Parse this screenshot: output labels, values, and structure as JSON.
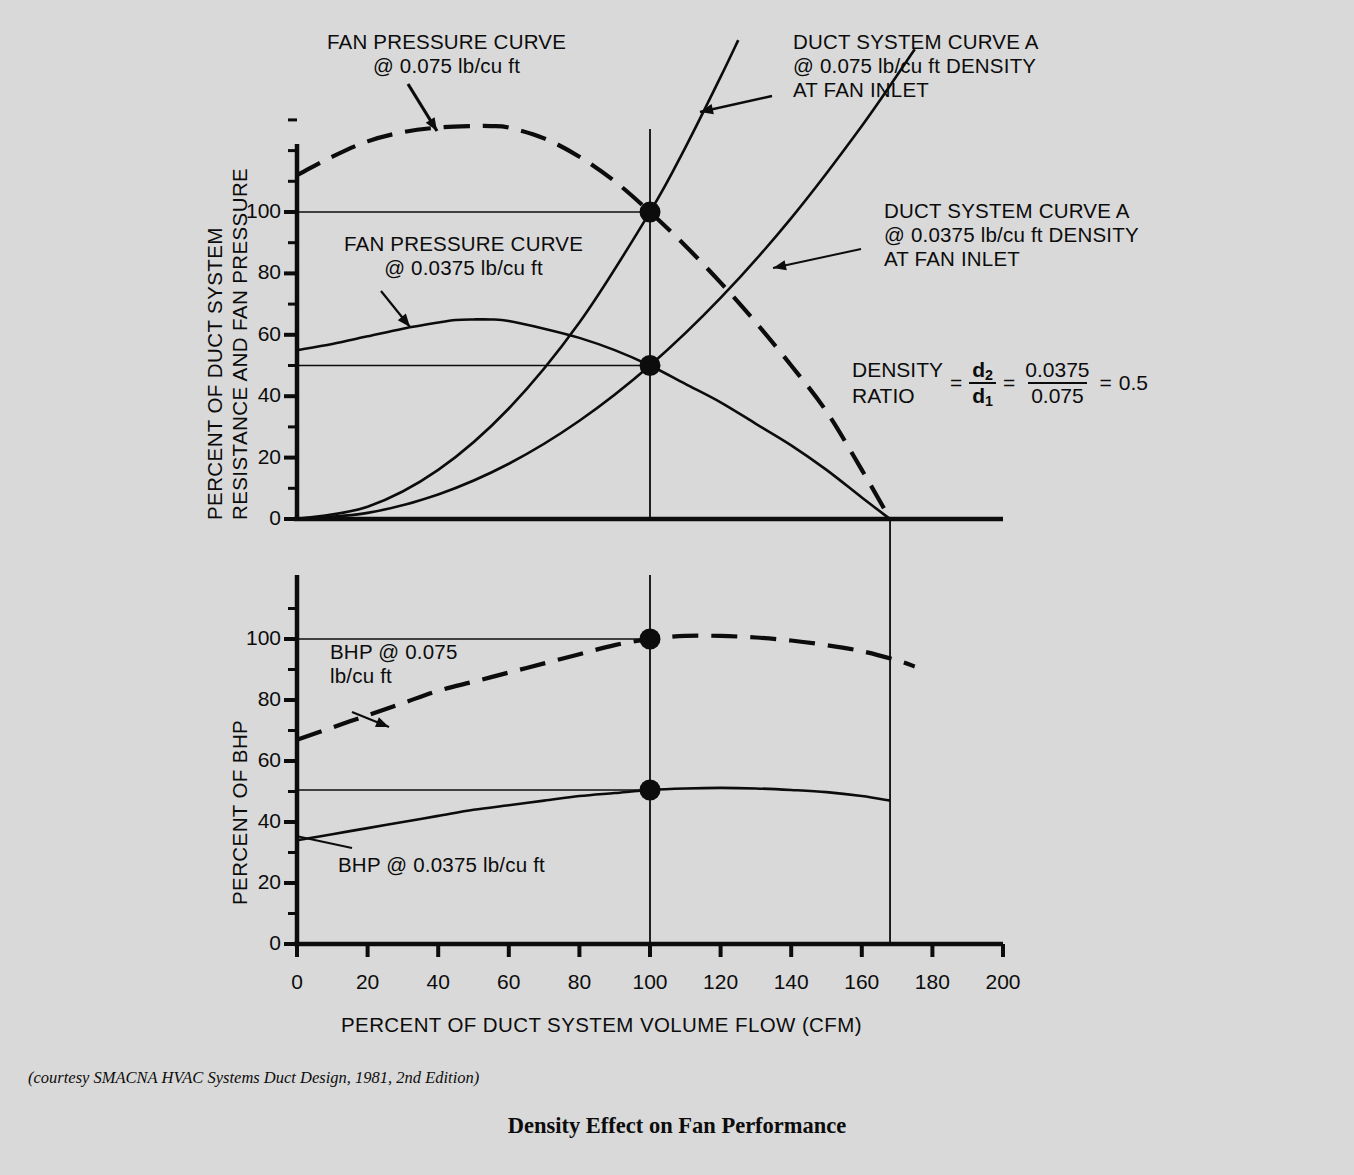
{
  "figure": {
    "title": "Density Effect on Fan Performance",
    "caption": "(courtesy SMACNA HVAC Systems Duct Design, 1981, 2nd Edition)",
    "background_color": "#d9d9d9",
    "ink_color": "#0c0c0c"
  },
  "annotations": {
    "fan_curve_075": "FAN PRESSURE CURVE\n@ 0.075 lb/cu ft",
    "duct_curve_075": "DUCT SYSTEM CURVE A\n@ 0.075 lb/cu ft DENSITY\nAT FAN INLET",
    "fan_curve_0375": "FAN PRESSURE CURVE\n@ 0.0375 lb/cu ft",
    "duct_curve_0375": "DUCT SYSTEM CURVE A\n@ 0.0375 lb/cu ft DENSITY\nAT FAN INLET",
    "bhp_075": "BHP @ 0.075\nlb/cu ft",
    "bhp_0375": "BHP @ 0.0375 lb/cu ft"
  },
  "equation": {
    "label_line1": "DENSITY",
    "label_line2": "RATIO",
    "equals": "=",
    "ratio_numerator": "d",
    "ratio_numerator_sub": "2",
    "ratio_denominator": "d",
    "ratio_denominator_sub": "1",
    "value_numerator": "0.0375",
    "value_denominator": "0.075",
    "result": "0.5"
  },
  "chart_data": [
    {
      "id": "pressure-chart",
      "type": "line",
      "title": "",
      "xlabel": "PERCENT OF DUCT SYSTEM VOLUME FLOW (CFM)",
      "ylabel": "PERCENT OF DUCT SYSTEM RESISTANCE AND FAN PRESSURE",
      "ylabel_line1": "PERCENT OF DUCT SYSTEM",
      "ylabel_line2": "RESISTANCE AND FAN PRESSURE",
      "xlim": [
        0,
        200
      ],
      "ylim": [
        0,
        130
      ],
      "xticks": [
        0,
        20,
        40,
        60,
        80,
        100,
        120,
        140,
        160,
        180,
        200
      ],
      "yticks": [
        0,
        20,
        40,
        60,
        80,
        100
      ],
      "ytick_labels": [
        "0",
        "20",
        "40",
        "60",
        "80",
        "100"
      ],
      "minor_ytick_step": 10,
      "grid": false,
      "series": [
        {
          "name": "FAN PRESSURE CURVE @ 0.075 lb/cu ft",
          "style": "dashed",
          "x": [
            0,
            10,
            20,
            30,
            40,
            50,
            55,
            60,
            70,
            80,
            90,
            100,
            110,
            120,
            130,
            140,
            150,
            160,
            168
          ],
          "values": [
            112,
            118,
            123,
            126,
            127.5,
            128,
            128,
            127.5,
            124,
            118,
            110,
            100,
            89,
            77,
            64,
            50,
            35,
            16,
            0
          ]
        },
        {
          "name": "FAN PRESSURE CURVE @ 0.0375 lb/cu ft",
          "style": "solid",
          "x": [
            0,
            10,
            20,
            30,
            40,
            45,
            50,
            55,
            60,
            70,
            80,
            90,
            100,
            110,
            120,
            130,
            140,
            150,
            160,
            168
          ],
          "values": [
            55,
            57,
            59.5,
            62,
            64,
            64.8,
            65,
            65,
            64.5,
            62,
            59,
            55,
            50,
            44,
            38,
            31,
            24,
            16,
            7,
            0
          ]
        },
        {
          "name": "DUCT SYSTEM CURVE A @ 0.075 lb/cu ft DENSITY AT FAN INLET",
          "style": "solid",
          "x": [
            0,
            20,
            40,
            60,
            80,
            100,
            110,
            120,
            125
          ],
          "values": [
            0,
            4,
            16,
            36,
            64,
            100,
            121,
            144,
            156
          ]
        },
        {
          "name": "DUCT SYSTEM CURVE A @ 0.0375 lb/cu ft DENSITY AT FAN INLET",
          "style": "solid",
          "x": [
            0,
            20,
            40,
            60,
            80,
            100,
            120,
            140,
            160,
            175
          ],
          "values": [
            0,
            2,
            8,
            18,
            32,
            50,
            72,
            98,
            128,
            153
          ]
        }
      ],
      "markers": [
        {
          "x": 100,
          "y": 100,
          "label": "operating point @ 0.075"
        },
        {
          "x": 100,
          "y": 50,
          "label": "operating point @ 0.0375"
        }
      ],
      "reference_lines": [
        {
          "orientation": "vertical",
          "value": 100
        },
        {
          "orientation": "vertical",
          "value": 168
        },
        {
          "orientation": "horizontal",
          "value": 100,
          "x_to": 100
        },
        {
          "orientation": "horizontal",
          "value": 50,
          "x_to": 100
        }
      ]
    },
    {
      "id": "bhp-chart",
      "type": "line",
      "title": "",
      "xlabel": "PERCENT OF DUCT SYSTEM VOLUME FLOW (CFM)",
      "ylabel": "PERCENT OF BHP",
      "xlim": [
        0,
        200
      ],
      "ylim": [
        0,
        120
      ],
      "xticks": [
        0,
        20,
        40,
        60,
        80,
        100,
        120,
        140,
        160,
        180,
        200
      ],
      "yticks": [
        0,
        20,
        40,
        60,
        80,
        100
      ],
      "ytick_labels": [
        "0",
        "20",
        "40",
        "60",
        "80",
        "100"
      ],
      "minor_ytick_step": 10,
      "grid": false,
      "series": [
        {
          "name": "BHP @ 0.075 lb/cu ft",
          "style": "dashed",
          "x": [
            0,
            10,
            20,
            30,
            40,
            50,
            60,
            70,
            80,
            90,
            100,
            110,
            120,
            130,
            140,
            150,
            160,
            170,
            175
          ],
          "values": [
            67,
            71,
            75,
            79,
            83,
            86,
            89,
            92,
            95,
            98,
            100,
            101,
            101,
            100.5,
            99.5,
            98,
            96,
            93,
            91
          ]
        },
        {
          "name": "BHP @ 0.0375 lb/cu ft",
          "style": "solid",
          "x": [
            0,
            10,
            20,
            30,
            40,
            50,
            60,
            70,
            80,
            90,
            100,
            110,
            120,
            130,
            140,
            150,
            160,
            168
          ],
          "values": [
            34,
            36,
            38,
            40,
            42,
            44,
            45.5,
            47,
            48.5,
            49.5,
            50.5,
            51,
            51.2,
            51,
            50.5,
            49.8,
            48.5,
            47
          ]
        }
      ],
      "markers": [
        {
          "x": 100,
          "y": 100,
          "label": "operating point @ 0.075"
        },
        {
          "x": 100,
          "y": 50.5,
          "label": "operating point @ 0.0375"
        }
      ],
      "reference_lines": [
        {
          "orientation": "vertical",
          "value": 100
        },
        {
          "orientation": "vertical",
          "value": 168
        },
        {
          "orientation": "horizontal",
          "value": 100,
          "x_to": 100
        },
        {
          "orientation": "horizontal",
          "value": 50.5,
          "x_to": 100
        }
      ]
    }
  ],
  "xaxis": {
    "label": "PERCENT OF DUCT SYSTEM VOLUME FLOW (CFM)",
    "tick_labels": [
      "0",
      "20",
      "40",
      "60",
      "80",
      "100",
      "120",
      "140",
      "160",
      "180",
      "200"
    ]
  }
}
